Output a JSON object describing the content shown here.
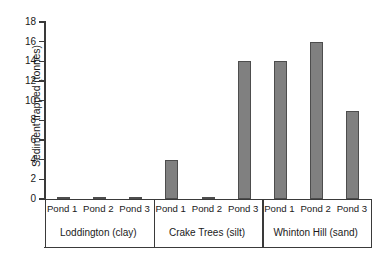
{
  "chart_data": {
    "type": "bar",
    "title": "",
    "xlabel": "",
    "ylabel": "Sediment trapped (tonnes)",
    "ylim": [
      0,
      18
    ],
    "ytick_step": 2,
    "yticks": [
      18,
      16,
      14,
      12,
      10,
      8,
      6,
      4,
      2,
      0
    ],
    "grid": false,
    "legend": "none",
    "bar_color": "#808080",
    "bar_border_color": "#4d4d4d",
    "axis_color": "#3a3a3a",
    "categories": [
      "Pond 1",
      "Pond 2",
      "Pond 3",
      "Pond 1",
      "Pond 2",
      "Pond 3",
      "Pond 1",
      "Pond 2",
      "Pond 3"
    ],
    "values": [
      0.1,
      0.1,
      0.05,
      4.0,
      0.2,
      14.0,
      14.0,
      16.0,
      9.0
    ],
    "groups": [
      {
        "label": "Loddington (clay)",
        "categories": [
          "Pond 1",
          "Pond 2",
          "Pond 3"
        ],
        "values": [
          0.1,
          0.1,
          0.05
        ]
      },
      {
        "label": "Crake Trees (silt)",
        "categories": [
          "Pond 1",
          "Pond 2",
          "Pond 3"
        ],
        "values": [
          4.0,
          0.2,
          14.0
        ]
      },
      {
        "label": "Whinton Hill (sand)",
        "categories": [
          "Pond 1",
          "Pond 2",
          "Pond 3"
        ],
        "values": [
          14.0,
          16.0,
          9.0
        ]
      }
    ]
  }
}
